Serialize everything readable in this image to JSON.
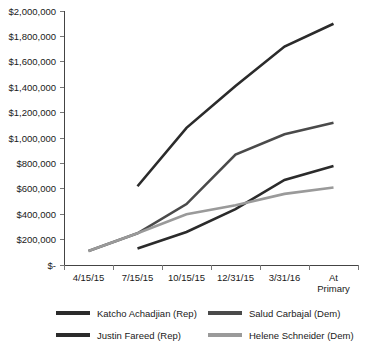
{
  "chart_data": {
    "type": "line",
    "title": "",
    "xlabel": "",
    "ylabel": "",
    "grid": false,
    "legend_position": "bottom",
    "categories": [
      "4/15/15",
      "7/15/15",
      "10/15/15",
      "12/31/15",
      "3/31/16",
      "At Primary"
    ],
    "category_lines": [
      [
        "4/15/15"
      ],
      [
        "7/15/15"
      ],
      [
        "10/15/15"
      ],
      [
        "12/31/15"
      ],
      [
        "3/31/16"
      ],
      [
        "At",
        "Primary"
      ]
    ],
    "ylim": [
      0,
      2000000
    ],
    "ytick_values": [
      0,
      200000,
      400000,
      600000,
      800000,
      1000000,
      1200000,
      1400000,
      1600000,
      1800000,
      2000000
    ],
    "ytick_labels": [
      "$-",
      "$200,000",
      "$400,000",
      "$600,000",
      "$800,000",
      "$1,000,000",
      "$1,200,000",
      "$1,400,000",
      "$1,600,000",
      "$1,800,000",
      "$2,000,000"
    ],
    "series": [
      {
        "name": "Katcho Achadjian (Rep)",
        "color": "#2b2b2b",
        "x": [
          "7/15/15",
          "10/15/15",
          "12/31/15",
          "3/31/16",
          "At Primary"
        ],
        "values": [
          620000,
          1080000,
          1410000,
          1720000,
          1900000
        ]
      },
      {
        "name": "Salud Carbajal (Dem)",
        "color": "#4a4a4a",
        "x": [
          "4/15/15",
          "7/15/15",
          "10/15/15",
          "12/31/15",
          "3/31/16",
          "At Primary"
        ],
        "values": [
          110000,
          250000,
          480000,
          870000,
          1030000,
          1120000
        ]
      },
      {
        "name": "Justin Fareed (Rep)",
        "color": "#2b2b2b",
        "x": [
          "7/15/15",
          "10/15/15",
          "12/31/15",
          "3/31/16",
          "At Primary"
        ],
        "values": [
          130000,
          260000,
          440000,
          670000,
          780000
        ]
      },
      {
        "name": "Helene Schneider (Dem)",
        "color": "#9a9a9a",
        "x": [
          "4/15/15",
          "7/15/15",
          "10/15/15",
          "12/31/15",
          "3/31/16",
          "At Primary"
        ],
        "values": [
          110000,
          250000,
          400000,
          470000,
          560000,
          610000
        ]
      }
    ]
  },
  "legend": {
    "items": [
      {
        "label": "Katcho Achadjian (Rep)",
        "color": "#2b2b2b"
      },
      {
        "label": "Salud Carbajal (Dem)",
        "color": "#4a4a4a"
      },
      {
        "label": "Justin Fareed (Rep)",
        "color": "#2b2b2b"
      },
      {
        "label": "Helene Schneider (Dem)",
        "color": "#9a9a9a"
      }
    ]
  }
}
